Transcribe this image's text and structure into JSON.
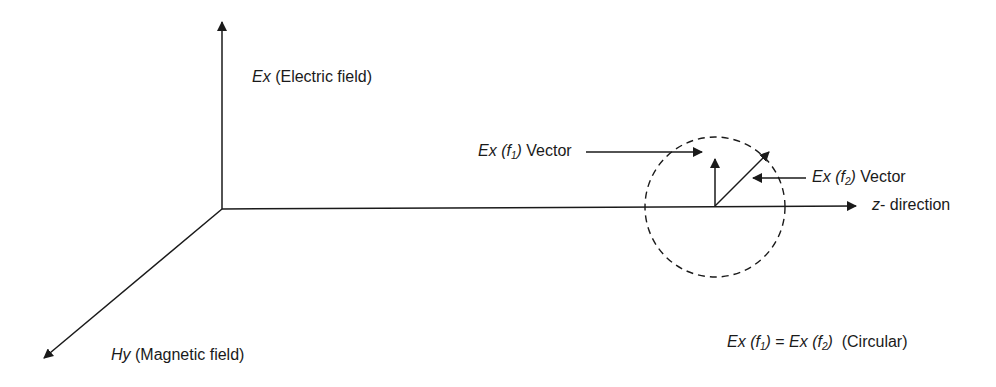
{
  "diagram": {
    "type": "electromagnetic-wave-polarization",
    "axes": {
      "vertical": {
        "symbol": "Ex",
        "description": "(Electric field)"
      },
      "depth": {
        "symbol": "Hy",
        "description": "(Magnetic field)"
      },
      "horizontal": {
        "symbol": "z",
        "description": "- direction"
      }
    },
    "vectors": [
      {
        "symbol": "Ex",
        "arg_open": "(",
        "var": "f",
        "sub": "1",
        "arg_close": ")",
        "suffix": "Vector"
      },
      {
        "symbol": "Ex",
        "arg_open": "(",
        "var": "f",
        "sub": "2",
        "arg_close": ")",
        "suffix": "Vector"
      }
    ],
    "equation": {
      "lhs_symbol": "Ex",
      "lhs_var": "f",
      "lhs_sub": "1",
      "equals": "=",
      "rhs_symbol": "Ex",
      "rhs_var": "f",
      "rhs_sub": "2",
      "note": "(Circular)"
    },
    "colors": {
      "stroke": "#1a1a1a",
      "background": "#ffffff"
    }
  }
}
